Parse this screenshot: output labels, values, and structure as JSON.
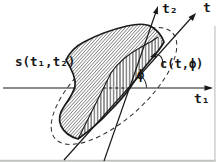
{
  "figure": {
    "labels": {
      "signal": "s(t₁,t₂)",
      "axis_t1": "t₁",
      "axis_t2": "t₂",
      "axis_t": "t",
      "angle_phi": "ϕ",
      "slice": "c(t,ϕ)"
    },
    "elements": {
      "support_region": "hatched-blob-support-of-s",
      "slice_band": "vertically-hatched-strip-along-t-axis",
      "dashed_ellipse": "dashed-ellipse-through-origin-region",
      "angle": "phi-between-t1-axis-and-t-axis"
    },
    "colors": {
      "ink": "#1a1a1a",
      "fine_hatch": "#4a4a4a",
      "band_hatch": "#222222",
      "background": "#ffffff",
      "scan_edge": "#bfc3bf"
    }
  }
}
